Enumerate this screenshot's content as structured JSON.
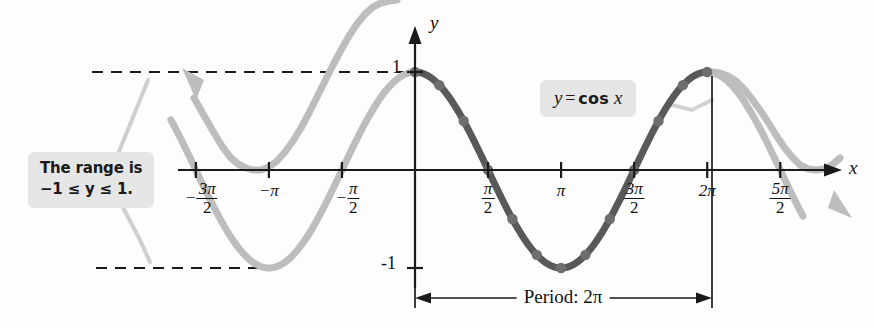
{
  "figure": {
    "title_equation": "y = cos x",
    "axis_labels": {
      "x": "x",
      "y": "y"
    },
    "y_ticks": [
      {
        "value": 1,
        "label": "1"
      },
      {
        "value": -1,
        "label": "-1"
      }
    ],
    "x_ticks": [
      {
        "value": -4.71238898038469,
        "num": "3π",
        "den": "2",
        "negative": true,
        "plain": "-3π/2"
      },
      {
        "value": -3.141592653589793,
        "plain": "−π",
        "simple": "−π"
      },
      {
        "value": -1.570796326794897,
        "num": "π",
        "den": "2",
        "negative": true,
        "plain": "-π/2"
      },
      {
        "value": 1.570796326794897,
        "num": "π",
        "den": "2",
        "negative": false,
        "plain": "π/2"
      },
      {
        "value": 3.141592653589793,
        "plain": "π",
        "simple": "π"
      },
      {
        "value": 4.71238898038469,
        "num": "3π",
        "den": "2",
        "negative": false,
        "plain": "3π/2"
      },
      {
        "value": 6.283185307179586,
        "plain": "2π",
        "simple": "2π"
      },
      {
        "value": 7.853981633974483,
        "num": "5π",
        "den": "2",
        "negative": false,
        "plain": "5π/2"
      }
    ],
    "period_annotation": {
      "label": "Period: 2π",
      "from": 0,
      "to": 6.283185307179586
    },
    "range_callout": {
      "line1": "The range is",
      "line2": "−1 ≤ y ≤ 1."
    },
    "equation_callout": {
      "lhs": "y",
      "eq": "=",
      "fn": "cos",
      "arg": "x"
    },
    "colors": {
      "highlight_curve": "#595959",
      "faded_curve": "#bdbdbd",
      "axis": "#1a1a1a",
      "point": "#6e6e6e",
      "callout_bg": "#e6e6e6",
      "dashed": "#1a1a1a"
    }
  },
  "chart_data": {
    "type": "line",
    "xlabel": "x",
    "ylabel": "y",
    "xlim": [
      -5.5,
      8.6
    ],
    "ylim": [
      -1.35,
      1.35
    ],
    "grid": false,
    "legend": "none",
    "function": "cos",
    "amplitude": 1,
    "period": 6.283185307179586,
    "range_min": -1,
    "range_max": 1,
    "highlighted_interval": [
      0,
      6.283185307179586
    ],
    "series": [
      {
        "name": "y = cos x",
        "x": [
          -5.4978,
          -5.236,
          -4.7124,
          -4.1888,
          -3.6652,
          -3.1416,
          -2.618,
          -2.0944,
          -1.5708,
          -1.0472,
          -0.5236,
          0,
          0.5236,
          1.0472,
          1.5708,
          2.0944,
          2.618,
          3.1416,
          3.6652,
          4.1888,
          4.7124,
          5.236,
          5.7596,
          6.2832,
          6.8068,
          7.3304,
          7.854,
          8.3776,
          8.6
        ],
        "y": [
          0.7071,
          0.5,
          0,
          -0.5,
          -0.866,
          -1,
          -0.866,
          -0.5,
          0,
          0.5,
          0.866,
          1,
          0.866,
          0.5,
          0,
          -0.5,
          -0.866,
          -1,
          -0.866,
          -0.5,
          0,
          0.5,
          0.866,
          1,
          0.866,
          0.5,
          0,
          -0.5,
          -0.7
        ]
      }
    ],
    "marked_points_x": [
      0,
      0.5236,
      1.0472,
      1.5708,
      2.0944,
      2.618,
      3.1416,
      3.6652,
      4.1888,
      4.7124,
      5.236,
      5.7596,
      6.2832
    ],
    "marked_points_y": [
      1,
      0.866,
      0.5,
      0,
      -0.5,
      -0.866,
      -1,
      -0.866,
      -0.5,
      0,
      0.5,
      0.866,
      1
    ],
    "reference_lines": [
      {
        "orientation": "horizontal",
        "y": 1,
        "style": "dashed"
      },
      {
        "orientation": "horizontal",
        "y": -1,
        "style": "dashed"
      }
    ]
  }
}
